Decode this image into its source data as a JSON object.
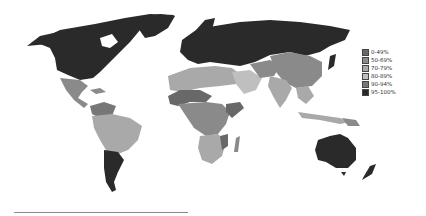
{
  "map": {
    "type": "choropleth world map",
    "palette": {
      "0-49%": "#686868",
      "50-69%": "#8a8a8a",
      "70-79%": "#a9a9a9",
      "80-89%": "#bfbfbf",
      "90-94%": "#777777",
      "95-100%": "#2a2a2a"
    }
  },
  "legend": {
    "items": [
      {
        "label": "0-49%",
        "color": "#686868"
      },
      {
        "label": "50-69%",
        "color": "#8a8a8a"
      },
      {
        "label": "70-79%",
        "color": "#a9a9a9"
      },
      {
        "label": "80-89%",
        "color": "#bfbfbf"
      },
      {
        "label": "90-94%",
        "color": "#777777"
      },
      {
        "label": "95-100%",
        "color": "#2a2a2a"
      }
    ]
  }
}
